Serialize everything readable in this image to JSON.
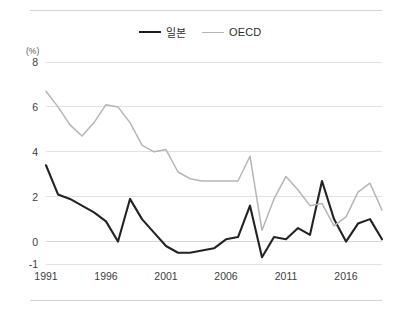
{
  "legend": {
    "position": "top-center",
    "entries": [
      {
        "label": "일본",
        "color": "#232323",
        "icon": "line-swatch-icon"
      },
      {
        "label": "OECD",
        "color": "#b6b6b6",
        "icon": "line-swatch-icon"
      }
    ]
  },
  "axes": {
    "y_unit_label": "(%)",
    "y_ticks": [
      "8",
      "6",
      "4",
      "2",
      "0",
      "-1"
    ],
    "y_tick_values": [
      8,
      6,
      4,
      2,
      0,
      -1
    ],
    "x_ticks": [
      "1991",
      "1996",
      "2001",
      "2006",
      "2011",
      "2016"
    ],
    "x_tick_values": [
      1991,
      1996,
      2001,
      2006,
      2011,
      2016
    ]
  },
  "chart_data": {
    "type": "line",
    "title": "",
    "subtitle": "",
    "xlabel": "",
    "ylabel": "(%)",
    "xlim": [
      1991,
      2019
    ],
    "ylim": [
      -1,
      8
    ],
    "grid": true,
    "legend_position": "top-center",
    "x": [
      1991,
      1992,
      1993,
      1994,
      1995,
      1996,
      1997,
      1998,
      1999,
      2000,
      2001,
      2002,
      2003,
      2004,
      2005,
      2006,
      2007,
      2008,
      2009,
      2010,
      2011,
      2012,
      2013,
      2014,
      2015,
      2016,
      2017,
      2018,
      2019
    ],
    "series": [
      {
        "name": "일본",
        "color": "#232323",
        "values": [
          3.4,
          2.1,
          1.9,
          1.6,
          1.3,
          0.9,
          0.0,
          1.9,
          1.0,
          0.4,
          -0.2,
          -0.5,
          -0.5,
          -0.4,
          -0.3,
          0.1,
          0.2,
          1.6,
          -0.7,
          0.2,
          0.1,
          0.6,
          0.3,
          2.7,
          1.0,
          0.0,
          0.8,
          1.0,
          0.1
        ]
      },
      {
        "name": "OECD",
        "color": "#b6b6b6",
        "values": [
          6.7,
          6.0,
          5.2,
          4.7,
          5.3,
          6.1,
          6.0,
          5.3,
          4.3,
          4.0,
          4.1,
          3.1,
          2.8,
          2.7,
          2.7,
          2.7,
          2.7,
          3.8,
          0.5,
          1.9,
          2.9,
          2.3,
          1.6,
          1.7,
          0.7,
          1.1,
          2.2,
          2.6,
          1.4
        ]
      }
    ]
  }
}
